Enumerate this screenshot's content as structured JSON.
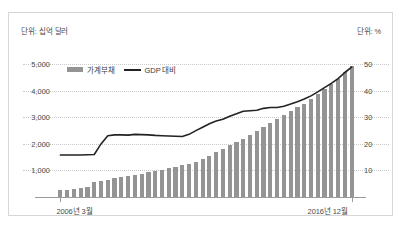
{
  "units": {
    "left": "단위: 십억 달러",
    "right": "단위: %"
  },
  "legend": {
    "bar": {
      "label": "가계부채",
      "color": "#949494"
    },
    "line": {
      "label": "GDP 대비",
      "color": "#222222"
    }
  },
  "axis": {
    "x_start_label": "2006년 3월",
    "x_end_label": "2016년 12월",
    "y_left_ticks": [
      "5,000",
      "4,000",
      "3,000",
      "2,000",
      "1,000"
    ],
    "y_right_ticks": [
      "50",
      "40",
      "30",
      "20",
      "10"
    ]
  },
  "chart_data": {
    "type": "bar",
    "title": "",
    "subtitle": "",
    "xlabel": "",
    "ylabel": "단위: 십억 달러",
    "y2label": "단위: %",
    "grid": true,
    "legend_position": "top-left",
    "ylim": [
      0,
      5500
    ],
    "y2lim": [
      0,
      55
    ],
    "y_ticks": [
      1000,
      2000,
      3000,
      4000,
      5000
    ],
    "y2_ticks": [
      10,
      20,
      30,
      40,
      50
    ],
    "categories": [
      "2006Q1",
      "2006Q2",
      "2006Q3",
      "2006Q4",
      "2007Q1",
      "2007Q2",
      "2007Q3",
      "2007Q4",
      "2008Q1",
      "2008Q2",
      "2008Q3",
      "2008Q4",
      "2009Q1",
      "2009Q2",
      "2009Q3",
      "2009Q4",
      "2010Q1",
      "2010Q2",
      "2010Q3",
      "2010Q4",
      "2011Q1",
      "2011Q2",
      "2011Q3",
      "2011Q4",
      "2012Q1",
      "2012Q2",
      "2012Q3",
      "2012Q4",
      "2013Q1",
      "2013Q2",
      "2013Q3",
      "2013Q4",
      "2014Q1",
      "2014Q2",
      "2014Q3",
      "2014Q4",
      "2015Q1",
      "2015Q2",
      "2015Q3",
      "2015Q4",
      "2016Q1",
      "2016Q2",
      "2016Q3",
      "2016Q4"
    ],
    "series": [
      {
        "name": "가계부채",
        "type": "bar",
        "axis": "left",
        "color": "#949494",
        "values": [
          250,
          280,
          300,
          330,
          370,
          560,
          600,
          640,
          700,
          740,
          790,
          830,
          870,
          930,
          980,
          1030,
          1080,
          1140,
          1200,
          1260,
          1320,
          1450,
          1560,
          1700,
          1820,
          1960,
          2080,
          2200,
          2330,
          2470,
          2620,
          2780,
          2930,
          3080,
          3230,
          3380,
          3520,
          3700,
          3880,
          4060,
          4240,
          4440,
          4700,
          4950
        ]
      },
      {
        "name": "GDP 대비",
        "type": "line",
        "axis": "right",
        "color": "#222222",
        "values": [
          15.8,
          15.8,
          15.8,
          15.8,
          15.9,
          16.0,
          20.0,
          23.1,
          23.4,
          23.4,
          23.3,
          23.6,
          23.5,
          23.4,
          23.2,
          23.1,
          23.0,
          22.9,
          22.8,
          23.6,
          25.0,
          26.3,
          27.6,
          28.6,
          29.3,
          30.4,
          31.4,
          32.3,
          32.5,
          32.7,
          33.4,
          33.7,
          33.7,
          34.2,
          35.0,
          35.9,
          36.9,
          38.1,
          39.6,
          41.2,
          42.8,
          44.6,
          46.9,
          48.9
        ]
      }
    ]
  }
}
